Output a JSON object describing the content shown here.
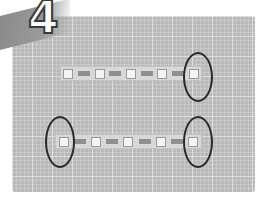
{
  "step": {
    "number": "4"
  },
  "image": {
    "description": "LED strip segments on a grid cutting mat with circled cut ends",
    "strips": [
      {
        "label": "upper-strip",
        "segments": 7,
        "circled_ends": [
          "right"
        ]
      },
      {
        "label": "lower-strip",
        "segments": 6,
        "circled_ends": [
          "left",
          "right"
        ]
      }
    ]
  },
  "colors": {
    "mat": "#b9b9b9",
    "circle": "#2a2a2a",
    "number_fill": "#ffffff",
    "number_outline": "#3a3a3a"
  }
}
